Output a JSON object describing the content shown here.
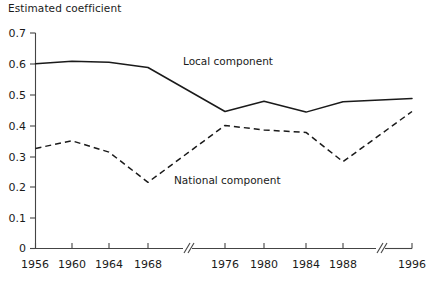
{
  "chart_data": {
    "type": "line",
    "title": "",
    "ylabel": "Estimated coefficient",
    "xlabel": "",
    "ylim": [
      0,
      0.7
    ],
    "yticks": [
      "0",
      "0.1",
      "0.2",
      "0.3",
      "0.4",
      "0.5",
      "0.6",
      "0.7"
    ],
    "ytick_values": [
      0,
      0.1,
      0.2,
      0.3,
      0.4,
      0.5,
      0.6,
      0.7
    ],
    "grid": false,
    "legend_position": "inline-annotations",
    "axis_breaks": [
      "between 1968 and 1976",
      "between 1988 and 1996"
    ],
    "categories": [
      "1956",
      "1960",
      "1964",
      "1968",
      "1976",
      "1980",
      "1984",
      "1988",
      "1996"
    ],
    "x": [
      1956,
      1960,
      1964,
      1968,
      1976,
      1980,
      1984,
      1988,
      1996
    ],
    "series": [
      {
        "name": "Local component",
        "style": "solid",
        "values": [
          0.6,
          0.608,
          0.605,
          0.588,
          0.445,
          0.478,
          0.443,
          0.477,
          0.487
        ]
      },
      {
        "name": "National component",
        "style": "dashed",
        "values": [
          0.325,
          0.35,
          0.313,
          0.215,
          0.4,
          0.385,
          0.377,
          0.282,
          0.445
        ]
      }
    ],
    "annotations": [
      {
        "text": "Local component",
        "x_px": 183,
        "y_px": 65
      },
      {
        "text": "National component",
        "x_px": 174,
        "y_px": 184
      }
    ]
  },
  "axis": {
    "y_title": "Estimated coefficient"
  }
}
